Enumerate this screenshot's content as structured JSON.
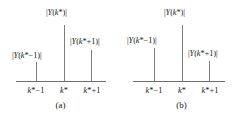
{
  "figure": {
    "background_color": "#ffffff",
    "stem_color": "#7d7d7d",
    "axis_color": "#6e6e6e",
    "text_color": "#1a1a1a"
  },
  "panels": [
    {
      "id": "a",
      "caption": "(a)",
      "tick_labels": [
        "k*−1",
        "k*",
        "k*+1"
      ],
      "stem_labels": [
        "|Y(k*−1)|",
        "|Y(k*)|",
        "|Y(k*+1)|"
      ]
    },
    {
      "id": "b",
      "caption": "(b)",
      "tick_labels": [
        "k*−1",
        "k*",
        "k*+1"
      ],
      "stem_labels": [
        "|Y(k*−1)|",
        "|Y(k*)|",
        "|Y(k*+1)|"
      ]
    }
  ],
  "chart_data": [
    {
      "type": "bar",
      "panel": "a",
      "title": "(a)",
      "xlabel": "",
      "ylabel": "",
      "categories": [
        "k*−1",
        "k*",
        "k*+1"
      ],
      "values": [
        19,
        56,
        31
      ],
      "value_labels": [
        "|Y(k*−1)|",
        "|Y(k*)|",
        "|Y(k*+1)|"
      ],
      "ylim": [
        0,
        60
      ],
      "grid": false,
      "legend": "none",
      "note": "Peak bin k* dominant; right neighbour k*+1 larger than left neighbour k*−1"
    },
    {
      "type": "bar",
      "panel": "b",
      "title": "(b)",
      "xlabel": "",
      "ylabel": "",
      "categories": [
        "k*−1",
        "k*",
        "k*+1"
      ],
      "values": [
        33,
        56,
        20
      ],
      "value_labels": [
        "|Y(k*−1)|",
        "|Y(k*)|",
        "|Y(k*+1)|"
      ],
      "ylim": [
        0,
        60
      ],
      "grid": false,
      "legend": "none",
      "note": "Peak bin k* dominant; left neighbour k*−1 larger than right neighbour k*+1"
    }
  ]
}
